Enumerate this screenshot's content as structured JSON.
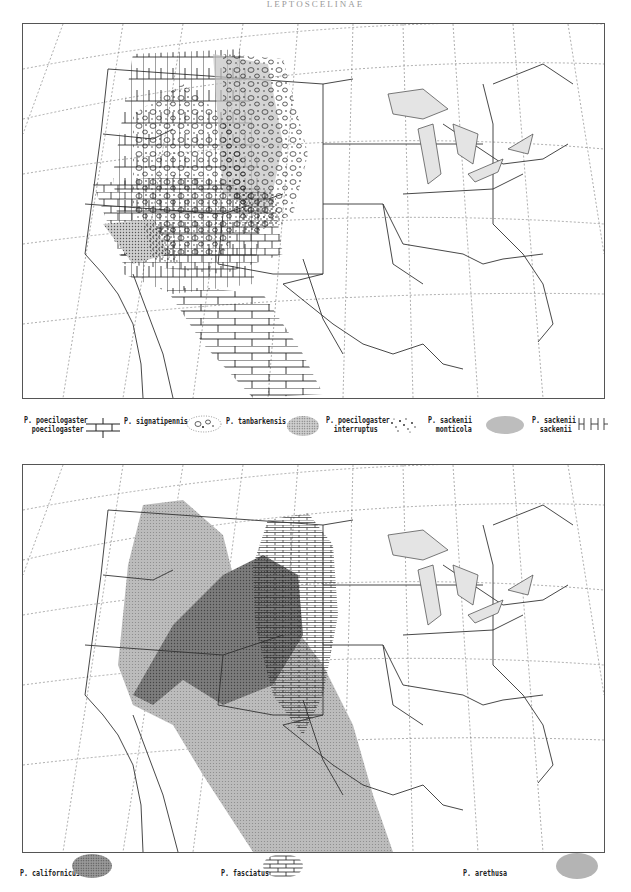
{
  "header": {
    "title": "LEPTOSCELINAE"
  },
  "maps": [
    {
      "id": "top",
      "region": "United States and northern Mexico",
      "legend": [
        {
          "label_line1": "P. poecilogaster",
          "label_line2": "poecilogaster",
          "pattern": "open-grid-hatching"
        },
        {
          "label_line1": "P. signatipennis",
          "label_line2": "",
          "pattern": "circles-stipple"
        },
        {
          "label_line1": "P. tanbarkensis",
          "label_line2": "",
          "pattern": "fine-dot-stipple"
        },
        {
          "label_line1": "P. poecilogaster",
          "label_line2": "interruptus",
          "pattern": "dense-speckle"
        },
        {
          "label_line1": "P. sackenii",
          "label_line2": "monticola",
          "pattern": "gray-shade"
        },
        {
          "label_line1": "P. sackenii",
          "label_line2": "sackenii",
          "pattern": "vertical-ticks"
        }
      ]
    },
    {
      "id": "bottom",
      "region": "United States and northern Mexico",
      "legend": [
        {
          "label_line1": "P. californicus",
          "label_line2": "",
          "pattern": "dark-dot-stipple"
        },
        {
          "label_line1": "P. fasciatus",
          "label_line2": "",
          "pattern": "brick-hatching"
        },
        {
          "label_line1": "P. arethusa",
          "label_line2": "",
          "pattern": "light-gray-shade"
        }
      ]
    }
  ],
  "colors": {
    "ink": "#222222",
    "grid": "#666666",
    "lakes": "#e4e4e4",
    "arethusa": "#b4b4b4",
    "californicus": "#7a7a7a",
    "monticola": "#c2c2c2"
  }
}
